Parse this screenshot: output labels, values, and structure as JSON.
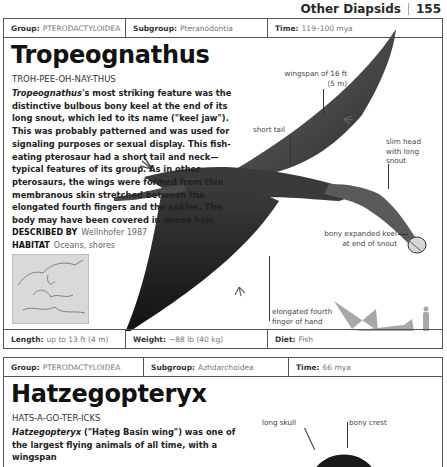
{
  "running_head": {
    "section": "Other Diapsids",
    "page_number": "155"
  },
  "entries": [
    {
      "meta": {
        "group_label": "Group:",
        "group_value": "PTERODACTYLOIDEA",
        "subgroup_label": "Subgroup:",
        "subgroup_value": "Pteranodontia",
        "time_label": "Time:",
        "time_value": "119–100 mya"
      },
      "name": "Tropeognathus",
      "pronunciation": "TROH-PEE-OH-NAY-THUS",
      "description_italic": "Tropeognathus",
      "description_rest": "'s most striking feature was the distinctive bulbous bony keel at the end of its long snout, which led to its name (\"keel jaw\"). This was probably patterned and was used for signaling purposes or sexual display. This fish-eating pterosaur had a short tail and neck—typical features of its group. As in other pterosaurs, the wings were formed from thin membranous skin stretched between the elongated fourth fingers and the ankles. The body may have been covered in dense hair.",
      "described_by_label": "DESCRIBED BY",
      "described_by_value": "Wellnhofer 1987",
      "habitat_label": "HABITAT",
      "habitat_value": "Oceans, shores",
      "annotations": {
        "wingspan": "wingspan of 16 ft (5 m)",
        "short_tail": "short tail",
        "slim_head": "slim head with long snout",
        "keel": "bony expanded keel at end of snout",
        "finger": "elongated fourth finger of hand"
      },
      "footer": {
        "length_label": "Length:",
        "length_value": "up to 13 ft (4 m)",
        "weight_label": "Weight:",
        "weight_value": "~88 lb (40 kg)",
        "diet_label": "Diet:",
        "diet_value": "Fish"
      }
    },
    {
      "meta": {
        "group_label": "Group:",
        "group_value": "PTERODACTYLOIDEA",
        "subgroup_label": "Subgroup:",
        "subgroup_value": "Azhdarchoidea",
        "time_label": "Time:",
        "time_value": "66 mya"
      },
      "name": "Hatzegopteryx",
      "pronunciation": "HATS-A-GO-TER-ICKS",
      "description_italic": "Hatzegopteryx",
      "description_rest": " (\"Hațeg Basin wing\") was one of the largest flying animals of all time, with a wingspan",
      "annotations": {
        "long_skull": "long skull",
        "bony_crest": "bony crest"
      }
    }
  ],
  "colors": {
    "border": "#555555",
    "creature_dark": "#2b2b2b",
    "silhouette": "#a8a8a8",
    "map_bg": "#d9d9d9"
  }
}
